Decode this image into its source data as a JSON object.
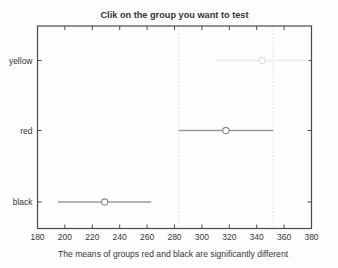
{
  "title": "Clik on the group you want to test",
  "caption": "The means of groups red and black are significantly different",
  "chart_data": {
    "type": "line",
    "subtype": "multcompare-interval-plot",
    "title": "Clik on the group you want to test",
    "xlabel": "The means of groups red and black are significantly different",
    "ylabel": "",
    "xlim": [
      180,
      380
    ],
    "xticks": [
      180,
      200,
      220,
      240,
      260,
      280,
      300,
      320,
      340,
      360,
      380
    ],
    "grid": false,
    "legend": "none",
    "categories": [
      "yellow",
      "red",
      "black"
    ],
    "groups": [
      {
        "name": "yellow",
        "mean": 344,
        "ci": [
          310,
          378
        ],
        "line_color": "#ececec",
        "marker_color": "#dedede"
      },
      {
        "name": "red",
        "mean": 317.5,
        "ci": [
          283,
          352
        ],
        "line_color": "#9a9a9a",
        "marker_color": "#8d8d8d"
      },
      {
        "name": "black",
        "mean": 229,
        "ci": [
          195,
          263
        ],
        "line_color": "#9a9a9a",
        "marker_color": "#8d8d8d"
      }
    ],
    "reference_lines_x": [
      283,
      352
    ],
    "reference_line_color": "#dcdcdc",
    "axis_color": "#4a4a4a",
    "text_color": "#363636",
    "marker_fill": "#fbfbfb"
  }
}
